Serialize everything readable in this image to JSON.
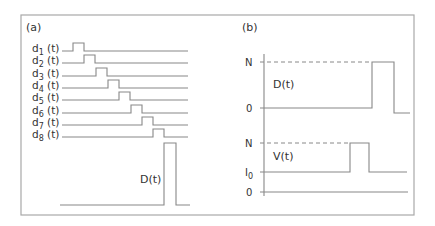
{
  "figure": {
    "frame": {
      "x": 21,
      "y": 15,
      "w": 393,
      "h": 200,
      "stroke": "#a8a8a8"
    },
    "line_color": "#888888",
    "text_color": "#333333"
  },
  "panel_a": {
    "label": "(a)",
    "rows": [
      {
        "label_base": "d",
        "sub": "1",
        "suffix": " (t)",
        "y": 51,
        "pulse_x": 73
      },
      {
        "label_base": "d",
        "sub": "2",
        "suffix": " (t)",
        "y": 63,
        "pulse_x": 84
      },
      {
        "label_base": "d",
        "sub": "3",
        "suffix": " (t)",
        "y": 76,
        "pulse_x": 96
      },
      {
        "label_base": "d",
        "sub": "4",
        "suffix": " (t)",
        "y": 88,
        "pulse_x": 108
      },
      {
        "label_base": "d",
        "sub": "5",
        "suffix": " (t)",
        "y": 100,
        "pulse_x": 119
      },
      {
        "label_base": "d",
        "sub": "6",
        "suffix": " (t)",
        "y": 113,
        "pulse_x": 131
      },
      {
        "label_base": "d",
        "sub": "7",
        "suffix": " (t)",
        "y": 125,
        "pulse_x": 142
      },
      {
        "label_base": "d",
        "sub": "8",
        "suffix": " (t)",
        "y": 137,
        "pulse_x": 153
      }
    ],
    "row_line": {
      "x_start": 62,
      "x_end": 188,
      "pulse_width": 11,
      "pulse_height": 8
    },
    "sum_signal": {
      "label": "D(t)",
      "baseline_y": 205,
      "top_y": 143,
      "x_start": 60,
      "rise_x": 164,
      "fall_x": 176,
      "x_end": 190
    }
  },
  "panel_b": {
    "label": "(b)",
    "axis_x": 264,
    "axis_top": 54,
    "axis_bottom": 196,
    "top_plot": {
      "signal_label": "D(t)",
      "ticks": [
        {
          "label": "N",
          "y": 62
        },
        {
          "label": "0",
          "y": 108
        }
      ],
      "rise_x": 372,
      "fall_x": 394,
      "after_y": 113,
      "x_end": 410
    },
    "bottom_plot": {
      "signal_label": "V(t)",
      "ticks": [
        {
          "label": "N",
          "y": 143
        },
        {
          "label": "I",
          "sub": "0",
          "y": 172
        },
        {
          "label": "0",
          "y": 192
        }
      ],
      "rise_x": 350,
      "fall_x": 369,
      "x_end": 407,
      "zero_end": 408
    }
  }
}
